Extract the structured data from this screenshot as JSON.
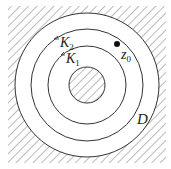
{
  "diagram": {
    "labels": {
      "k2": "K",
      "k2_sub": "2",
      "k1": "K",
      "k1_sub": "1",
      "z0": "z",
      "z0_sub": "0",
      "d": "D"
    },
    "colors": {
      "stroke": "#333333",
      "hatch": "#555555",
      "background": "#ffffff"
    }
  }
}
